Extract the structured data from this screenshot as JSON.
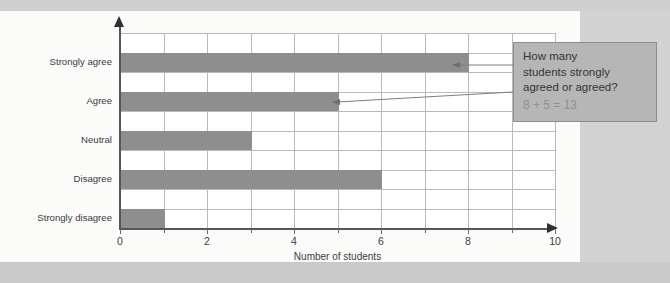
{
  "chart_data": {
    "type": "bar",
    "orientation": "horizontal",
    "title": "",
    "xlabel": "Number of students",
    "ylabel": "",
    "categories": [
      "Strongly agree",
      "Agree",
      "Neutral",
      "Disagree",
      "Strongly disagree"
    ],
    "values": [
      8,
      5,
      3,
      6,
      1
    ],
    "xlim": [
      0,
      10
    ],
    "xticks": [
      0,
      1,
      2,
      3,
      4,
      5,
      6,
      7,
      8,
      9,
      10
    ],
    "xticklabels": [
      "0",
      "",
      "2",
      "",
      "4",
      "",
      "6",
      "",
      "8",
      "",
      "10"
    ],
    "grid": true,
    "legend": null,
    "bar_color": "#8e8e8e",
    "annotations": [
      {
        "name": "callout",
        "question": "How many students strongly agreed or agreed?",
        "question_lines": [
          "How many",
          "students strongly",
          "agreed or agreed?"
        ],
        "answer": "8 + 5 = 13",
        "points_to": [
          "Strongly agree",
          "Agree"
        ]
      }
    ]
  },
  "callout": {
    "line1": "How many",
    "line2": "students strongly",
    "line3": "agreed or agreed?",
    "answer": "8 + 5 = 13"
  },
  "axis": {
    "xlabel": "Number of students",
    "ticks": [
      "0",
      "2",
      "4",
      "6",
      "8",
      "10"
    ]
  },
  "categories": [
    {
      "label": "Strongly agree",
      "value": 8
    },
    {
      "label": "Agree",
      "value": 5
    },
    {
      "label": "Neutral",
      "value": 3
    },
    {
      "label": "Disagree",
      "value": 6
    },
    {
      "label": "Strongly disagree",
      "value": 1
    }
  ],
  "colors": {
    "bar": "#8e8e8e",
    "grid": "#b9b9b9",
    "axis": "#55565a",
    "callout_bg": "#b6b6b6",
    "callout_answer": "#8f8f8f",
    "panel": "#fbfbfa",
    "page": "#d3d3d3"
  }
}
